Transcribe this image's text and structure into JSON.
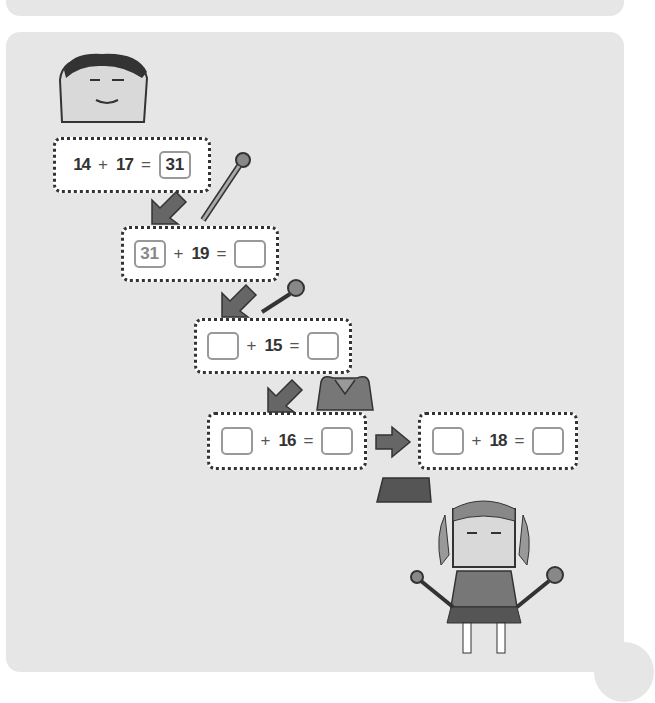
{
  "equations": [
    {
      "a": "14",
      "op": "+",
      "b": "17",
      "eq": "=",
      "result": "31",
      "a_box": false
    },
    {
      "a": "31",
      "op": "+",
      "b": "19",
      "eq": "=",
      "result": "",
      "a_box": true
    },
    {
      "a": "",
      "op": "+",
      "b": "15",
      "eq": "=",
      "result": "",
      "a_box": true
    },
    {
      "a": "",
      "op": "+",
      "b": "16",
      "eq": "=",
      "result": "",
      "a_box": true
    },
    {
      "a": "",
      "op": "+",
      "b": "18",
      "eq": "=",
      "result": "",
      "a_box": true
    }
  ],
  "colors": {
    "panel": "#e6e6e6",
    "arrow": "#666666",
    "border": "#333333"
  }
}
